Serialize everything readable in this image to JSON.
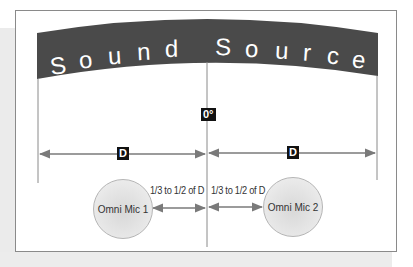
{
  "banner": {
    "title": "Sound Source",
    "letters_left": [
      "S",
      "o",
      "u",
      "n",
      "d"
    ],
    "letters_right": [
      "S",
      "o",
      "u",
      "r",
      "c",
      "e"
    ],
    "color": "#4a4a4a",
    "text_color": "#ffffff"
  },
  "center_axis": {
    "label": "0°"
  },
  "distances": {
    "left_label": "D",
    "right_label": "D",
    "left_gap_label": "1/3 to 1/2 of D",
    "right_gap_label": "1/3 to 1/2 of D"
  },
  "mics": [
    {
      "label": "Omni Mic 1"
    },
    {
      "label": "Omni Mic 2"
    }
  ],
  "colors": {
    "arrow": "#7a7a7a",
    "frame": "#8a8a8a",
    "background_gray": "#ebebeb",
    "label_box": "#111111"
  }
}
